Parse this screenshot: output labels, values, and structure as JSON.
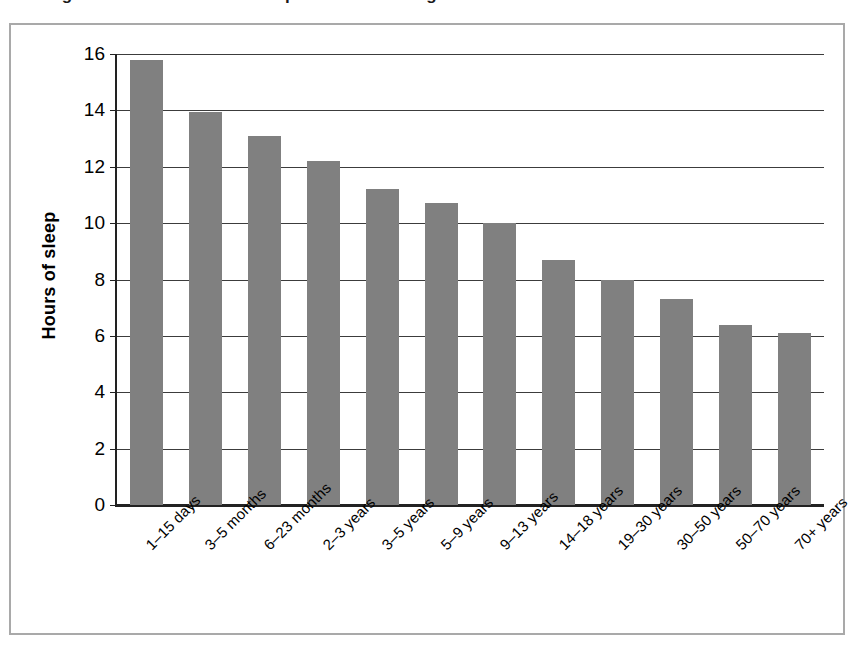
{
  "figure": {
    "title": "Average number of hours of sleep we need as we grow",
    "frame_border_color": "#a9a9a9",
    "background_color": "#ffffff"
  },
  "chart_data": {
    "type": "bar",
    "title": "Average number of hours of sleep we need as we grow",
    "xlabel": "",
    "ylabel": "Hours of sleep",
    "ylim": [
      0,
      16
    ],
    "ytick_labels": [
      "0",
      "2",
      "4",
      "6",
      "8",
      "10",
      "12",
      "14",
      "16"
    ],
    "ytick_values": [
      0,
      2,
      4,
      6,
      8,
      10,
      12,
      14,
      16
    ],
    "grid": true,
    "grid_axis": "y",
    "legend": false,
    "bar_color": "#808080",
    "categories": [
      "1–15 days",
      "3–5 months",
      "6–23 months",
      "2–3 years",
      "3–5 years",
      "5–9 years",
      "9–13 years",
      "14–18 years",
      "19–30 years",
      "30–50 years",
      "50–70 years",
      "70+ years"
    ],
    "values": [
      15.8,
      13.95,
      13.1,
      12.2,
      11.2,
      10.7,
      10.0,
      8.7,
      8.0,
      7.3,
      6.4,
      6.1
    ]
  }
}
